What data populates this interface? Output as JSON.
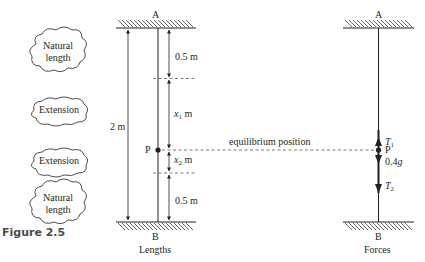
{
  "figure": {
    "caption": "Figure 2.5"
  },
  "clouds": [
    {
      "line1": "Natural",
      "line2": "length"
    },
    {
      "line1": "Extension",
      "line2": ""
    },
    {
      "line1": "Extension",
      "line2": ""
    },
    {
      "line1": "Natural",
      "line2": "length"
    }
  ],
  "lengths_diagram": {
    "top_label": "A",
    "bottom_label": "B",
    "caption": "Lengths",
    "total_length": "2 m",
    "top_segment": "0.5 m",
    "x1_var": "x",
    "x1_sub": "1",
    "x1_unit": " m",
    "x2_var": "x",
    "x2_sub": "2",
    "x2_unit": " m",
    "bottom_segment": "0.5 m",
    "point_label": "P"
  },
  "equilibrium": {
    "label": "equilibrium position"
  },
  "forces_diagram": {
    "top_label": "A",
    "bottom_label": "B",
    "caption": "Forces",
    "point_label": "P",
    "t1_var": "T",
    "t1_sub": "1",
    "weight_num": "0.4",
    "weight_var": "g",
    "t2_var": "T",
    "t2_sub": "2"
  },
  "colors": {
    "ink": "#231f20",
    "caption": "#4a4a4c",
    "background": "#ffffff"
  }
}
